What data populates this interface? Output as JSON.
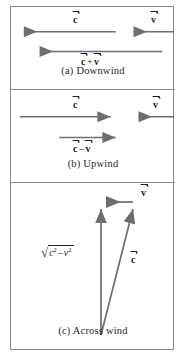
{
  "figure": {
    "panels": [
      {
        "id": "downwind",
        "caption": "(a) Downwind",
        "vectors": [
          {
            "name": "c-vector",
            "label": "c",
            "direction": "left"
          },
          {
            "name": "v-vector",
            "label": "v",
            "direction": "left"
          },
          {
            "name": "resultant-vector",
            "label_parts": {
              "first": "c",
              "operator": "+",
              "second": "v"
            },
            "direction": "left"
          }
        ]
      },
      {
        "id": "upwind",
        "caption": "(b) Upwind",
        "vectors": [
          {
            "name": "c-vector",
            "label": "c",
            "direction": "right"
          },
          {
            "name": "v-vector",
            "label": "v",
            "direction": "left"
          },
          {
            "name": "resultant-vector",
            "label_parts": {
              "first": "c",
              "operator": "–",
              "second": "v"
            },
            "direction": "right"
          }
        ]
      },
      {
        "id": "across-wind",
        "caption": "(c) Across wind",
        "vectors": [
          {
            "name": "v-vector",
            "label": "v",
            "direction": "left"
          },
          {
            "name": "c-vector",
            "label": "c",
            "direction": "up-right"
          },
          {
            "name": "resultant-vector",
            "label": "sqrt(c^2 - v^2)",
            "direction": "up"
          }
        ],
        "radical": {
          "symbol": "√",
          "base1": "c",
          "exp1": "2",
          "operator": "–",
          "base2": "v",
          "exp2": "2"
        }
      }
    ],
    "colors": {
      "arrow": "#6d6e71",
      "border": "#8a8a8a",
      "text": "#231f20",
      "background": "#ffffff"
    }
  }
}
